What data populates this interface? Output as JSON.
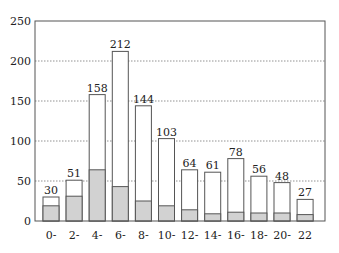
{
  "chart_data": {
    "type": "bar",
    "title": "",
    "xlabel": "",
    "ylabel": "",
    "ylim": [
      0,
      250
    ],
    "yticks": [
      0,
      50,
      100,
      150,
      200,
      250
    ],
    "grid": "horizontal dotted",
    "legend": null,
    "stacked_overlay": true,
    "categories": [
      "0-",
      "2-",
      "4-",
      "6-",
      "8-",
      "10-",
      "12-",
      "14-",
      "16-",
      "18-",
      "20-",
      "22"
    ],
    "series": [
      {
        "name": "total",
        "fill": "#ffffff",
        "values": [
          30,
          51,
          158,
          212,
          144,
          103,
          64,
          61,
          78,
          56,
          48,
          27
        ]
      },
      {
        "name": "shaded portion",
        "fill": "#d2d2d2",
        "values": [
          19,
          31,
          64,
          43,
          25,
          19,
          14,
          9,
          11,
          10,
          10,
          8
        ]
      }
    ],
    "data_labels": [
      "30",
      "51",
      "158",
      "212",
      "144",
      "103",
      "64",
      "61",
      "78",
      "56",
      "48",
      "27"
    ]
  }
}
